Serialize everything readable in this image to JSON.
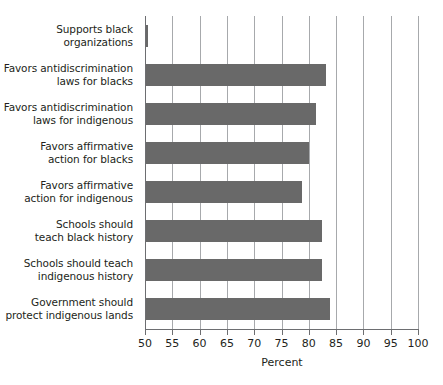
{
  "chart_data": {
    "type": "bar",
    "orientation": "horizontal",
    "title": "",
    "xlabel": "Percent",
    "ylabel": "",
    "xlim": [
      50,
      100
    ],
    "xticks": [
      50,
      55,
      60,
      65,
      70,
      75,
      80,
      85,
      90,
      95,
      100
    ],
    "xtick_labels": [
      "50",
      "55",
      "60",
      "65",
      "70",
      "75",
      "80",
      "85",
      "90",
      "95",
      "100"
    ],
    "grid": "vertical",
    "legend": "none",
    "bar_color": "#696969",
    "gridline_color": "#a7a9ac",
    "axis_color": "#6d6e71",
    "categories": [
      "Supports black organizations",
      "Favors antidiscrimination laws for blacks",
      "Favors antidiscrimination laws for indigenous",
      "Favors affirmative action for blacks",
      "Favors affirmative action for indigenous",
      "Schools should teach black history",
      "Schools should teach indigenous history",
      "Government should protect indigenous lands"
    ],
    "category_lines": [
      [
        "Supports black",
        "organizations"
      ],
      [
        "Favors antidiscrimination",
        "laws for blacks"
      ],
      [
        "Favors antidiscrimination",
        "laws for indigenous"
      ],
      [
        "Favors affirmative",
        "action for blacks"
      ],
      [
        "Favors affirmative",
        "action for indigenous"
      ],
      [
        "Schools should",
        "teach black history"
      ],
      [
        "Schools should teach",
        "indigenous history"
      ],
      [
        "Government should",
        "protect indigenous lands"
      ]
    ],
    "values": [
      50.6,
      83.1,
      81.4,
      80.0,
      78.8,
      82.5,
      82.4,
      83.8
    ]
  }
}
